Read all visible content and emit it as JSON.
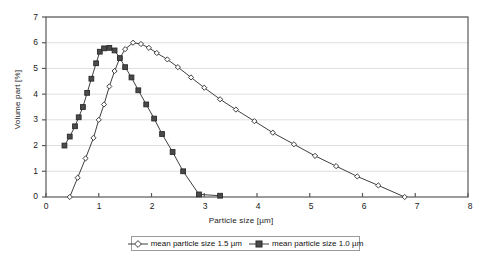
{
  "chart_data": {
    "type": "line",
    "title": "",
    "xlabel": "Particle size [µm]",
    "ylabel": "Volume part [%]",
    "xlim": [
      0,
      8
    ],
    "ylim": [
      0,
      7
    ],
    "xticks": [
      "0",
      "1",
      "2",
      "3",
      "4",
      "5",
      "6",
      "7",
      "8"
    ],
    "yticks": [
      "0",
      "1",
      "2",
      "3",
      "4",
      "5",
      "6",
      "7"
    ],
    "grid": "horizontal",
    "legend_position": "bottom",
    "series": [
      {
        "name": "mean particle size 1.5 µm",
        "marker": "open-diamond",
        "color": "#3f3f3f",
        "x": [
          0.45,
          0.6,
          0.75,
          0.9,
          1.0,
          1.1,
          1.2,
          1.3,
          1.4,
          1.5,
          1.65,
          1.8,
          1.95,
          2.1,
          2.3,
          2.5,
          2.75,
          3.0,
          3.3,
          3.6,
          3.95,
          4.3,
          4.7,
          5.1,
          5.5,
          5.9,
          6.3,
          6.8
        ],
        "y": [
          0.0,
          0.75,
          1.5,
          2.3,
          3.0,
          3.6,
          4.3,
          4.9,
          5.4,
          5.75,
          6.0,
          5.95,
          5.8,
          5.6,
          5.35,
          5.05,
          4.65,
          4.25,
          3.8,
          3.4,
          2.95,
          2.5,
          2.05,
          1.6,
          1.2,
          0.8,
          0.45,
          0.0
        ]
      },
      {
        "name": "mean particle size 1.0 µm",
        "marker": "filled-square",
        "color": "#3f3f3f",
        "x": [
          0.35,
          0.45,
          0.55,
          0.62,
          0.7,
          0.78,
          0.86,
          0.95,
          1.02,
          1.1,
          1.2,
          1.3,
          1.4,
          1.5,
          1.62,
          1.75,
          1.9,
          2.05,
          2.2,
          2.4,
          2.6,
          2.9,
          3.3
        ],
        "y": [
          2.0,
          2.35,
          2.75,
          3.1,
          3.5,
          4.05,
          4.6,
          5.2,
          5.65,
          5.78,
          5.8,
          5.7,
          5.4,
          5.05,
          4.65,
          4.15,
          3.6,
          3.05,
          2.45,
          1.75,
          1.0,
          0.1,
          0.05
        ]
      }
    ]
  },
  "legend": {
    "entries": [
      {
        "label": "mean particle size 1.5 µm"
      },
      {
        "label": "mean particle size 1.0 µm"
      }
    ]
  }
}
